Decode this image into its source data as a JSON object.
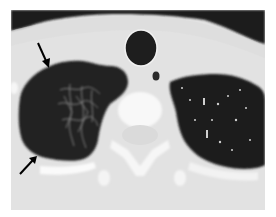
{
  "image": {
    "type": "axial chest CT, lung window",
    "description": "Right upper lobe region with hyperlucent lung containing reticular opacities; arrows mark its margins",
    "annotations": [
      {
        "kind": "arrow",
        "label": "upper-arrow",
        "from": [
          38,
          43
        ],
        "to": [
          49,
          67
        ]
      },
      {
        "kind": "arrow",
        "label": "lower-arrow",
        "from": [
          20,
          174
        ],
        "to": [
          36,
          157
        ]
      }
    ],
    "colors": {
      "background": "#ffffff",
      "soft_tissue": "#e4e4e4",
      "air": "#1e1e1e",
      "bone": "#fafafa",
      "arrow": "#000000"
    }
  }
}
